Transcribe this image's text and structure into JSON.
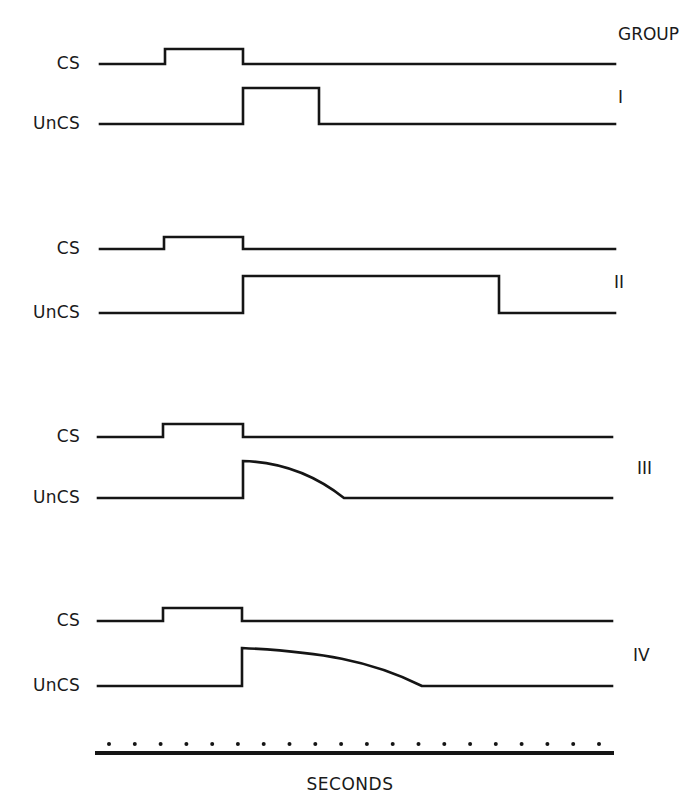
{
  "figure": {
    "header": "GROUP",
    "x_axis_label": "SECONDS",
    "colors": {
      "ink": "#151515",
      "background": "#ffffff"
    }
  },
  "chart_data": {
    "type": "timing-diagram",
    "x_axis": {
      "label": "SECONDS",
      "tick_marks": 20,
      "tick_style": "dots"
    },
    "groups": [
      {
        "name": "I",
        "CS": {
          "on_start_px": 165,
          "on_end_px": 243
        },
        "UnCS": {
          "onset_px": 243,
          "offset_px": 319,
          "shape": "rectangular"
        }
      },
      {
        "name": "II",
        "CS": {
          "on_start_px": 164,
          "on_end_px": 243
        },
        "UnCS": {
          "onset_px": 243,
          "offset_px": 499,
          "shape": "rectangular"
        }
      },
      {
        "name": "III",
        "CS": {
          "on_start_px": 163,
          "on_end_px": 243
        },
        "UnCS": {
          "onset_px": 243,
          "offset_px": 344,
          "shape": "decaying-curve"
        }
      },
      {
        "name": "IV",
        "CS": {
          "on_start_px": 163,
          "on_end_px": 242
        },
        "UnCS": {
          "onset_px": 242,
          "offset_px": 422,
          "shape": "decaying-curve"
        }
      }
    ],
    "row_labels": [
      "CS",
      "UnCS"
    ]
  },
  "rows": [
    {
      "cs_label": "CS",
      "ucs_label": "UnCS",
      "group": "I"
    },
    {
      "cs_label": "CS",
      "ucs_label": "UnCS",
      "group": "II"
    },
    {
      "cs_label": "CS",
      "ucs_label": "UnCS",
      "group": "III"
    },
    {
      "cs_label": "CS",
      "ucs_label": "UnCS",
      "group": "IV"
    }
  ]
}
